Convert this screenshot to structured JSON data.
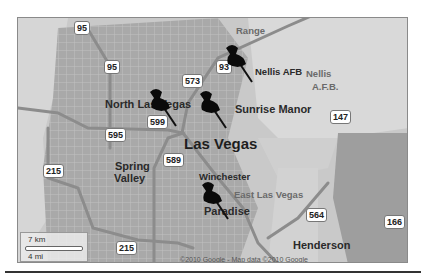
{
  "map": {
    "city": "Las Vegas",
    "places": [
      {
        "name": "North Las Vegas",
        "x": 87,
        "y": 81,
        "size": "med"
      },
      {
        "name": "Las Vegas",
        "x": 166,
        "y": 118,
        "size": "big"
      },
      {
        "name": "Sunrise Manor",
        "x": 217,
        "y": 86,
        "size": "med"
      },
      {
        "name": "Nellis AFB",
        "x": 237,
        "y": 49,
        "size": "sm"
      },
      {
        "name": "Nellis",
        "x": 288,
        "y": 51,
        "size": "sm",
        "style": "light"
      },
      {
        "name": "A.F.B.",
        "x": 294,
        "y": 64,
        "size": "sm",
        "style": "light"
      },
      {
        "name": "Range",
        "x": 218,
        "y": 8,
        "size": "sm",
        "style": "light"
      },
      {
        "name": "Spring",
        "x": 97,
        "y": 143,
        "size": "med"
      },
      {
        "name": "Valley",
        "x": 96,
        "y": 155,
        "size": "med"
      },
      {
        "name": "Winchester",
        "x": 181,
        "y": 154,
        "size": "sm"
      },
      {
        "name": "East Las Vegas",
        "x": 216,
        "y": 172,
        "size": "sm",
        "style": "light"
      },
      {
        "name": "Paradise",
        "x": 186,
        "y": 188,
        "size": "med"
      },
      {
        "name": "Henderson",
        "x": 275,
        "y": 222,
        "size": "med"
      },
      {
        "name": "Arden",
        "x": 100,
        "y": 243,
        "size": "sm",
        "style": "light"
      }
    ],
    "shields": [
      {
        "label": "95",
        "x": 56,
        "y": 3
      },
      {
        "label": "95",
        "x": 86,
        "y": 42
      },
      {
        "label": "573",
        "x": 164,
        "y": 56
      },
      {
        "label": "93",
        "x": 198,
        "y": 42
      },
      {
        "label": "599",
        "x": 129,
        "y": 97
      },
      {
        "label": "595",
        "x": 87,
        "y": 110
      },
      {
        "label": "147",
        "x": 312,
        "y": 92
      },
      {
        "label": "589",
        "x": 145,
        "y": 135
      },
      {
        "label": "215",
        "x": 25,
        "y": 146
      },
      {
        "label": "215",
        "x": 98,
        "y": 223
      },
      {
        "label": "564",
        "x": 288,
        "y": 190
      },
      {
        "label": "166",
        "x": 366,
        "y": 197
      }
    ],
    "pins": [
      {
        "name": "pin-nellis",
        "x": 204,
        "y": 26
      },
      {
        "name": "pin-north-las-vegas",
        "x": 128,
        "y": 70
      },
      {
        "name": "pin-sunrise-manor",
        "x": 178,
        "y": 72
      },
      {
        "name": "pin-paradise",
        "x": 180,
        "y": 163
      }
    ],
    "scale": {
      "km": "7 km",
      "mi": "4 mi"
    },
    "copyright": "©2010 Google - Map data ©2010 Google"
  }
}
